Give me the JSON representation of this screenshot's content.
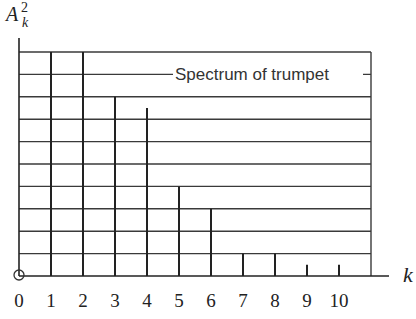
{
  "chart_data": {
    "type": "bar",
    "title": "Spectrum of trumpet",
    "xlabel": "k",
    "ylabel": "A_k^2",
    "ylabel_parts": {
      "base": "A",
      "sup": "2",
      "sub": "k"
    },
    "categories": [
      "0",
      "1",
      "2",
      "3",
      "4",
      "5",
      "6",
      "7",
      "8",
      "9",
      "10"
    ],
    "x": [
      0,
      1,
      2,
      3,
      4,
      5,
      6,
      7,
      8,
      9,
      10
    ],
    "values": [
      0,
      10,
      10,
      8,
      7.5,
      4,
      3,
      1,
      1,
      0.5,
      0.5
    ],
    "ylim": [
      0,
      10
    ],
    "xlim": [
      0,
      11
    ],
    "grid": true,
    "grid_rows": 10,
    "y_ticks_labeled": false,
    "legend": {
      "text": "Spectrum of trumpet",
      "position": "inside-top-right"
    },
    "annotations": [
      "origin circle at (0,0)"
    ],
    "colors": {
      "line": "#222222",
      "grid": "#3a3a3a",
      "text": "#333333"
    }
  }
}
